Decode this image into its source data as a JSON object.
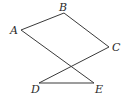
{
  "diagram": {
    "stroke_color": "#3a3a3a",
    "points": [
      {
        "name": "A",
        "x": 21,
        "y": 30,
        "label_x": 10,
        "label_y": 25
      },
      {
        "name": "B",
        "x": 64,
        "y": 13,
        "label_x": 59,
        "label_y": 2
      },
      {
        "name": "C",
        "x": 109,
        "y": 47,
        "label_x": 112,
        "label_y": 42
      },
      {
        "name": "D",
        "x": 39,
        "y": 83,
        "label_x": 31,
        "label_y": 84
      },
      {
        "name": "E",
        "x": 94,
        "y": 83,
        "label_x": 95,
        "label_y": 84
      }
    ],
    "segments": [
      [
        "A",
        "B"
      ],
      [
        "B",
        "C"
      ],
      [
        "C",
        "D"
      ],
      [
        "D",
        "E"
      ],
      [
        "E",
        "A"
      ]
    ]
  }
}
